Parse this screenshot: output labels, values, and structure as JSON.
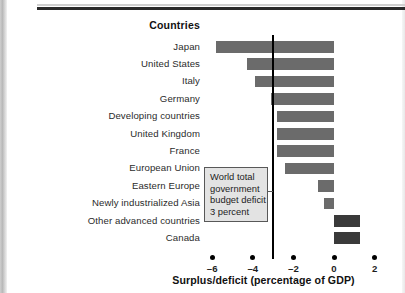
{
  "header": {
    "column_header": "Countries"
  },
  "callout": {
    "lines": [
      "World total",
      "government",
      "budget deficit",
      "3 percent"
    ],
    "value": -3
  },
  "axis": {
    "title": "Surplus/deficit (percentage of GDP)",
    "ticks": [
      "–6",
      "–4",
      "–2",
      "0",
      "2"
    ],
    "tick_values": [
      -6,
      -4,
      -2,
      0,
      2
    ]
  },
  "colors": {
    "bar_negative": "#6b6b6b",
    "bar_positive": "#3a3a3a",
    "callout_fill": "#e3e3e3",
    "callout_border": "#585858",
    "reference_line": "#000000",
    "rule": "#2a2a2a"
  },
  "chart_data": {
    "type": "bar",
    "orientation": "horizontal",
    "title": "",
    "subtitle": "",
    "xlabel": "Surplus/deficit (percentage of GDP)",
    "ylabel": "Countries",
    "xlim": [
      -6.8,
      2.2
    ],
    "xticks": [
      -6,
      -4,
      -2,
      0,
      2
    ],
    "grid": false,
    "legend": "none",
    "categories": [
      "Japan",
      "United States",
      "Italy",
      "Germany",
      "Developing countries",
      "United Kingdom",
      "France",
      "European Union",
      "Eastern Europe",
      "Newly industrialized Asia",
      "Other advanced countries",
      "Canada"
    ],
    "values": [
      -5.8,
      -4.3,
      -3.9,
      -3.1,
      -2.8,
      -2.8,
      -2.8,
      -2.4,
      -0.8,
      -0.5,
      1.3,
      1.3
    ],
    "annotations": [
      {
        "type": "vline",
        "value": -3,
        "label": "World total government budget deficit 3 percent"
      }
    ]
  }
}
